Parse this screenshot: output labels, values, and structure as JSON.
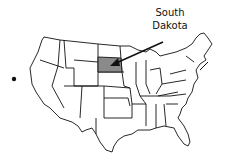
{
  "map": {
    "title": "United States",
    "highlighted_state": "South Dakota",
    "highlight_color": "#8a8a8a",
    "outline_color": "#111111",
    "background_color": "#ffffff"
  },
  "label": {
    "line1": "South",
    "line2": "Dakota"
  }
}
